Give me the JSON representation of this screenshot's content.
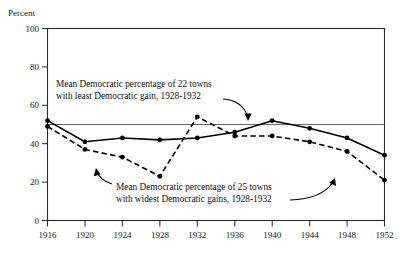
{
  "chart_data": {
    "type": "line",
    "title": "",
    "xlabel": "",
    "ylabel": "Percent",
    "x": [
      1916,
      1920,
      1924,
      1928,
      1932,
      1936,
      1940,
      1944,
      1948,
      1952
    ],
    "xtick_labels": [
      "1916",
      "1920",
      "1924",
      "1928",
      "1932",
      "1936",
      "1940",
      "1944",
      "1948",
      "1952"
    ],
    "ytick_labels": [
      "0",
      "20",
      "40",
      "60",
      "80",
      "100"
    ],
    "yticks": [
      0,
      20,
      40,
      60,
      80,
      100
    ],
    "xlim": [
      1916,
      1952
    ],
    "ylim": [
      0,
      100
    ],
    "grid": false,
    "legend_position": "none",
    "reference_line": 50,
    "series": [
      {
        "name": "Mean Democratic percentage of 22 towns with least Democratic gain, 1928-1932",
        "style": "solid",
        "values": [
          52,
          41,
          43,
          42,
          43,
          46,
          52,
          48,
          43,
          34
        ]
      },
      {
        "name": "Mean Democratic percentage of 25 towns with widest Democratic gains, 1928-1932",
        "style": "dashed",
        "values": [
          49,
          37,
          33,
          23,
          54,
          44,
          44,
          41,
          36,
          21
        ]
      }
    ],
    "annotations": [
      {
        "id": "annotation-least-gain",
        "line1": "Mean Democratic percentage of 22 towns",
        "line2": "with least Democratic gain, 1928-1932",
        "points_to_series": "solid"
      },
      {
        "id": "annotation-widest-gains",
        "line1": "Mean Democratic percentage of 25 towns",
        "line2": "with widest Democratic gains, 1928-1932",
        "points_to_series": "dashed"
      }
    ],
    "colors": {
      "line": "#000000",
      "frame": "#2a2a2a",
      "reference": "#555555",
      "text": "#111111",
      "background": "#ffffff"
    }
  }
}
